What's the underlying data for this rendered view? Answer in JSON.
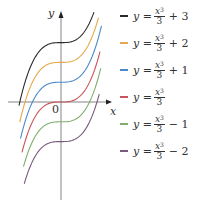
{
  "chart_data": {
    "type": "line",
    "title": "",
    "xlabel": "x",
    "ylabel": "y",
    "origin_label": "0",
    "grid": false,
    "legend_position": "right",
    "function_family": "y = x^3/3 + c",
    "series": [
      {
        "name": "y = x³/3 + 3",
        "c": 3,
        "color": "#2b2b2b",
        "u_range": [
          -2.8,
          2.2
        ]
      },
      {
        "name": "y = x³/3 + 2",
        "c": 2,
        "color": "#e6a84a",
        "u_range": [
          -2.75,
          2.5
        ]
      },
      {
        "name": "y = x³/3 + 1",
        "c": 1,
        "color": "#4a8ac9",
        "u_range": [
          -2.7,
          2.7
        ]
      },
      {
        "name": "y = x³/3",
        "c": 0,
        "color": "#c9555a",
        "u_range": [
          -2.6,
          2.6
        ]
      },
      {
        "name": "y = x³/3 − 1",
        "c": -1,
        "color": "#7fae6b",
        "u_range": [
          -2.5,
          2.65
        ]
      },
      {
        "name": "y = x³/3 − 2",
        "c": -2,
        "color": "#7a5a7e",
        "u_range": [
          -2.45,
          2.55
        ]
      }
    ]
  },
  "legend": {
    "items": [
      {
        "lhs": "y",
        "eq": "=",
        "num": "x",
        "exp": "3",
        "den": "3",
        "suffix": "+ 3",
        "color": "#2b2b2b"
      },
      {
        "lhs": "y",
        "eq": "=",
        "num": "x",
        "exp": "3",
        "den": "3",
        "suffix": "+ 2",
        "color": "#e6a84a"
      },
      {
        "lhs": "y",
        "eq": "=",
        "num": "x",
        "exp": "3",
        "den": "3",
        "suffix": "+ 1",
        "color": "#4a8ac9"
      },
      {
        "lhs": "y",
        "eq": "=",
        "num": "x",
        "exp": "3",
        "den": "3",
        "suffix": "",
        "color": "#c9555a"
      },
      {
        "lhs": "y",
        "eq": "=",
        "num": "x",
        "exp": "3",
        "den": "3",
        "suffix": "− 1",
        "color": "#7fae6b"
      },
      {
        "lhs": "y",
        "eq": "=",
        "num": "x",
        "exp": "3",
        "den": "3",
        "suffix": "− 2",
        "color": "#7a5a7e"
      }
    ]
  },
  "axes": {
    "x_label": "x",
    "y_label": "y",
    "origin": "0"
  }
}
